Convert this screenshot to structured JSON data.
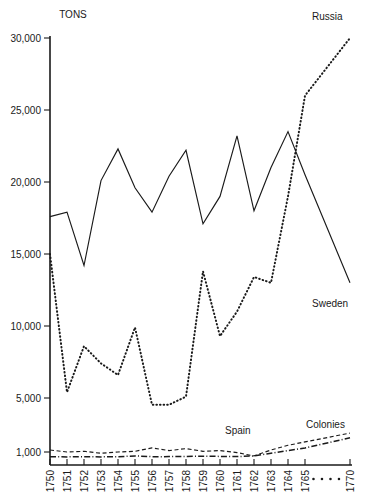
{
  "chart_data": {
    "type": "line",
    "title": "",
    "subtitle": "",
    "ylabel": "TONS",
    "xlabel": "",
    "grid": false,
    "legend_position": "inline-right-of-series",
    "x_axis": {
      "tick_labels": [
        "1750",
        "1751",
        "1752",
        "1753",
        "1754",
        "1755",
        "1756",
        "1757",
        "1758",
        "1759",
        "1760",
        "1761",
        "1762",
        "1763",
        "1764",
        "1765",
        "1770"
      ],
      "gap_marker": "· · · ·",
      "gap_note": "break between 1765 and 1770",
      "rotated_labels": true
    },
    "y_axis": {
      "tick_labels": [
        "30,000",
        "25,000",
        "20,000",
        "15,000",
        "10,000",
        "5,000",
        "1,000"
      ],
      "tick_values": [
        30000,
        25000,
        20000,
        15000,
        10000,
        5000,
        1000
      ],
      "ylim": [
        1000,
        30000
      ],
      "scale_note": "linear from 5,000 to 30,000; compressed segment below 5,000 down to 1,000"
    },
    "series": [
      {
        "name": "Sweden",
        "style": "solid",
        "label": "Sweden",
        "x": [
          "1750",
          "1751",
          "1752",
          "1753",
          "1754",
          "1755",
          "1756",
          "1757",
          "1758",
          "1759",
          "1760",
          "1761",
          "1762",
          "1763",
          "1764",
          "1765",
          "1770"
        ],
        "values": [
          17600,
          17900,
          14200,
          20100,
          22300,
          19600,
          17900,
          20400,
          22200,
          17100,
          19000,
          23200,
          18000,
          21000,
          23500,
          20500,
          13000
        ]
      },
      {
        "name": "Russia",
        "style": "dotted",
        "label": "Russia",
        "x": [
          "1750",
          "1751",
          "1752",
          "1753",
          "1754",
          "1755",
          "1756",
          "1757",
          "1758",
          "1759",
          "1760",
          "1761",
          "1762",
          "1763",
          "1764",
          "1765",
          "1770"
        ],
        "values": [
          15000,
          5400,
          8600,
          7400,
          6600,
          9900,
          4500,
          4500,
          5100,
          13800,
          9300,
          11000,
          13400,
          13000,
          19000,
          26000,
          30000
        ]
      },
      {
        "name": "Spain",
        "style": "dashed",
        "label": "Spain",
        "x": [
          "1750",
          "1751",
          "1752",
          "1753",
          "1754",
          "1755",
          "1756",
          "1757",
          "1758",
          "1759",
          "1760",
          "1761",
          "1762",
          "1763",
          "1764",
          "1765",
          "1770"
        ],
        "values": [
          1150,
          1000,
          1050,
          900,
          1000,
          1050,
          1300,
          1100,
          1250,
          1050,
          1100,
          950,
          700,
          1150,
          1500,
          1750,
          2400
        ]
      },
      {
        "name": "Colonies",
        "style": "dash-dot",
        "label": "Colonies",
        "x": [
          "1750",
          "1751",
          "1752",
          "1753",
          "1754",
          "1755",
          "1756",
          "1757",
          "1758",
          "1759",
          "1760",
          "1761",
          "1762",
          "1763",
          "1764",
          "1765",
          "1770"
        ],
        "values": [
          640,
          620,
          640,
          620,
          640,
          700,
          640,
          650,
          660,
          680,
          660,
          650,
          700,
          900,
          1100,
          1300,
          2050
        ]
      }
    ]
  },
  "labels": {
    "tons": "TONS",
    "russia": "Russia",
    "sweden": "Sweden",
    "spain": "Spain",
    "colonies": "Colonies"
  },
  "colors": {
    "ink": "#1a1a1a",
    "paper": "#ffffff"
  }
}
